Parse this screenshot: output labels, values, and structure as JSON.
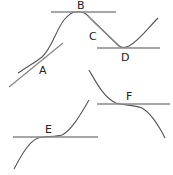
{
  "diagram": {
    "colors": {
      "curve": "#555555",
      "tangent": "#888888",
      "label": "#222222"
    },
    "labels": {
      "A": "A",
      "B": "B",
      "C": "C",
      "D": "D",
      "E": "E",
      "F": "F"
    },
    "points": [
      {
        "id": "A",
        "description": "increasing, tangent with positive slope"
      },
      {
        "id": "B",
        "description": "local maximum, horizontal tangent"
      },
      {
        "id": "C",
        "description": "decreasing, tangent coincides with straight segment"
      },
      {
        "id": "D",
        "description": "local minimum, horizontal tangent"
      },
      {
        "id": "E",
        "description": "horizontal inflection, increasing curve"
      },
      {
        "id": "F",
        "description": "horizontal inflection, decreasing curve"
      }
    ]
  }
}
